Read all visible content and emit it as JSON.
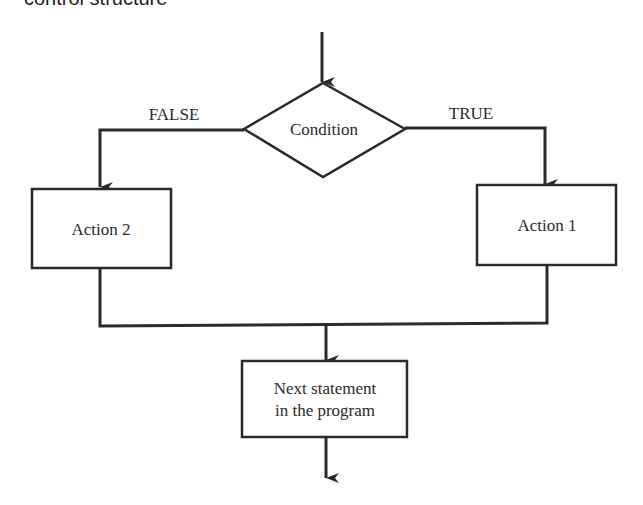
{
  "header": {
    "clipped_title": "control structure"
  },
  "diagram": {
    "type": "flowchart-if-then-else",
    "decision": {
      "label": "Condition"
    },
    "branches": {
      "false_label": "FALSE",
      "true_label": "TRUE"
    },
    "actions": {
      "left": "Action 2",
      "right": "Action 1"
    },
    "next": {
      "line1": "Next statement",
      "line2": "in the program"
    },
    "colors": {
      "stroke": "#2a2a2a",
      "background": "#ffffff"
    }
  }
}
